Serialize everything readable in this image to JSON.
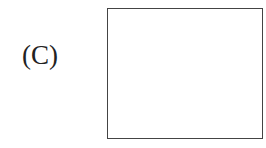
{
  "figure": {
    "label": "(C)",
    "box": {
      "content": "",
      "border_color": "#444444"
    }
  }
}
